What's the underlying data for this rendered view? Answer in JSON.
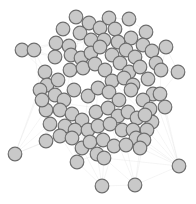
{
  "diagram": {
    "type": "network-graph",
    "layout": "force-directed",
    "width": 196,
    "height": 204,
    "background": "#ffffff",
    "node_style": {
      "radius": 6.8,
      "fill": "#c9c9c9",
      "stroke": "#6e6e6e"
    },
    "edge_style": {
      "stroke": "#cfcfcf"
    },
    "nodes": [
      [
        22,
        50
      ],
      [
        34,
        50
      ],
      [
        15,
        154
      ],
      [
        46,
        141
      ],
      [
        102,
        186
      ],
      [
        135,
        185
      ],
      [
        179,
        166
      ],
      [
        82,
        148
      ],
      [
        77,
        162
      ],
      [
        76,
        17
      ],
      [
        89,
        23
      ],
      [
        63,
        29
      ],
      [
        80,
        33
      ],
      [
        100,
        28
      ],
      [
        109,
        18
      ],
      [
        115,
        29
      ],
      [
        129,
        19
      ],
      [
        146,
        32
      ],
      [
        143,
        45
      ],
      [
        131,
        38
      ],
      [
        56,
        43
      ],
      [
        69,
        46
      ],
      [
        91,
        40
      ],
      [
        104,
        40
      ],
      [
        118,
        42
      ],
      [
        126,
        50
      ],
      [
        135,
        57
      ],
      [
        152,
        51
      ],
      [
        166,
        47
      ],
      [
        156,
        63
      ],
      [
        161,
        70
      ],
      [
        55,
        57
      ],
      [
        71,
        55
      ],
      [
        81,
        58
      ],
      [
        91,
        53
      ],
      [
        100,
        47
      ],
      [
        112,
        55
      ],
      [
        120,
        63
      ],
      [
        129,
        72
      ],
      [
        140,
        67
      ],
      [
        148,
        79
      ],
      [
        178,
        72
      ],
      [
        45,
        72
      ],
      [
        47,
        85
      ],
      [
        58,
        80
      ],
      [
        70,
        70
      ],
      [
        83,
        68
      ],
      [
        95,
        64
      ],
      [
        105,
        70
      ],
      [
        112,
        81
      ],
      [
        124,
        78
      ],
      [
        133,
        85
      ],
      [
        153,
        94
      ],
      [
        160,
        94
      ],
      [
        165,
        107
      ],
      [
        40,
        90
      ],
      [
        55,
        95
      ],
      [
        64,
        100
      ],
      [
        74,
        90
      ],
      [
        88,
        96
      ],
      [
        98,
        88
      ],
      [
        109,
        92
      ],
      [
        119,
        100
      ],
      [
        131,
        90
      ],
      [
        143,
        100
      ],
      [
        150,
        109
      ],
      [
        152,
        122
      ],
      [
        147,
        130
      ],
      [
        46,
        110
      ],
      [
        60,
        110
      ],
      [
        72,
        114
      ],
      [
        82,
        120
      ],
      [
        96,
        112
      ],
      [
        108,
        108
      ],
      [
        118,
        116
      ],
      [
        128,
        112
      ],
      [
        137,
        118
      ],
      [
        145,
        115
      ],
      [
        42,
        100
      ],
      [
        65,
        126
      ],
      [
        75,
        130
      ],
      [
        88,
        130
      ],
      [
        98,
        126
      ],
      [
        110,
        124
      ],
      [
        122,
        130
      ],
      [
        133,
        130
      ],
      [
        136,
        138
      ],
      [
        144,
        140
      ],
      [
        60,
        136
      ],
      [
        72,
        138
      ],
      [
        90,
        142
      ],
      [
        103,
        140
      ],
      [
        114,
        146
      ],
      [
        126,
        145
      ],
      [
        140,
        148
      ],
      [
        97,
        154
      ],
      [
        104,
        158
      ],
      [
        50,
        124
      ]
    ],
    "edges": [
      [
        2,
        3
      ],
      [
        2,
        42
      ],
      [
        2,
        55
      ],
      [
        3,
        56
      ],
      [
        3,
        68
      ],
      [
        3,
        43
      ],
      [
        4,
        7
      ],
      [
        4,
        8
      ],
      [
        4,
        92
      ],
      [
        5,
        52
      ],
      [
        5,
        83
      ],
      [
        5,
        93
      ],
      [
        6,
        53
      ],
      [
        6,
        54
      ],
      [
        6,
        66
      ],
      [
        6,
        84
      ],
      [
        6,
        40
      ],
      [
        6,
        96
      ],
      [
        7,
        59
      ],
      [
        7,
        71
      ],
      [
        8,
        88
      ],
      [
        8,
        89
      ],
      [
        0,
        42
      ],
      [
        1,
        55
      ],
      [
        0,
        20
      ],
      [
        1,
        31
      ],
      [
        9,
        10
      ],
      [
        11,
        12
      ],
      [
        13,
        14
      ],
      [
        15,
        16
      ],
      [
        17,
        18
      ],
      [
        19,
        20
      ],
      [
        21,
        22
      ],
      [
        23,
        24
      ],
      [
        25,
        26
      ],
      [
        27,
        28
      ],
      [
        29,
        30
      ],
      [
        31,
        32
      ],
      [
        33,
        34
      ],
      [
        35,
        36
      ],
      [
        37,
        38
      ],
      [
        39,
        40
      ],
      [
        41,
        29
      ],
      [
        42,
        43
      ],
      [
        44,
        45
      ],
      [
        46,
        47
      ],
      [
        48,
        49
      ],
      [
        50,
        51
      ],
      [
        52,
        53
      ],
      [
        55,
        56
      ],
      [
        57,
        58
      ],
      [
        59,
        60
      ],
      [
        61,
        62
      ],
      [
        63,
        64
      ],
      [
        65,
        66
      ],
      [
        67,
        68
      ],
      [
        69,
        70
      ],
      [
        71,
        72
      ],
      [
        73,
        74
      ],
      [
        75,
        76
      ],
      [
        77,
        78
      ],
      [
        79,
        80
      ],
      [
        81,
        82
      ],
      [
        83,
        84
      ],
      [
        85,
        86
      ],
      [
        87,
        88
      ],
      [
        89,
        90
      ],
      [
        91,
        92
      ],
      [
        93,
        94
      ],
      [
        95,
        96
      ],
      [
        97,
        98
      ],
      [
        10,
        33
      ],
      [
        22,
        47
      ],
      [
        24,
        38
      ],
      [
        28,
        41
      ],
      [
        45,
        58
      ],
      [
        60,
        72
      ],
      [
        64,
        77
      ],
      [
        70,
        81
      ],
      [
        74,
        85
      ],
      [
        90,
        94
      ],
      [
        12,
        57
      ],
      [
        30,
        53
      ],
      [
        49,
        66
      ],
      [
        54,
        65
      ],
      [
        61,
        86
      ],
      [
        48,
        73
      ]
    ]
  }
}
